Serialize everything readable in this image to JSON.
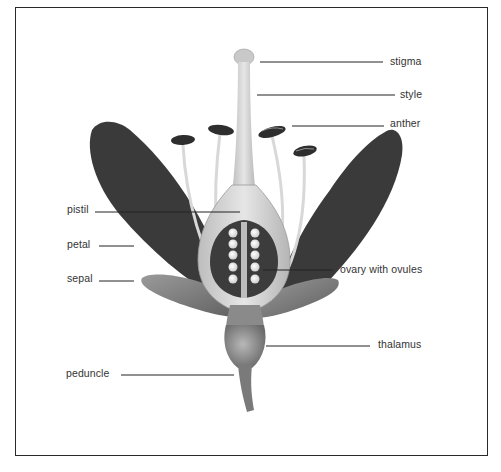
{
  "diagram": {
    "labels": {
      "stigma": "stigma",
      "style": "style",
      "anther": "anther",
      "pistil": "pistil",
      "petal": "petal",
      "sepal": "sepal",
      "ovary": "ovary with ovules",
      "thalamus": "thalamus",
      "peduncle": "peduncle"
    },
    "colors": {
      "frame": "#2a2a2a",
      "petal": "#3a3a3a",
      "sepal": "#7a7a7a",
      "pistil": "#cfcfcf",
      "ovule": "#f2f2f2",
      "leader_line": "#222222",
      "label_text": "#333333"
    },
    "ovule_count": 10,
    "stamen_count": 4
  }
}
